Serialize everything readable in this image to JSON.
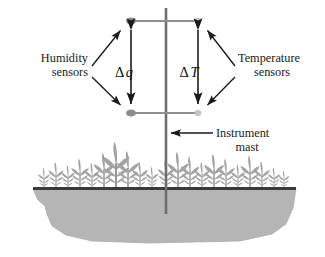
{
  "figure": {
    "type": "schematic-diagram",
    "width": 325,
    "height": 257,
    "background_color": "#ffffff"
  },
  "labels": {
    "humidity": {
      "line1": "Humidity",
      "line2": "sensors",
      "align": "right",
      "anchor_x": 88,
      "line1_y": 62,
      "line2_y": 76
    },
    "temperature": {
      "line1": "Temperature",
      "line2": "sensors",
      "align": "left",
      "anchor_x": 238,
      "line1_y": 62,
      "line2_y": 76
    },
    "instrument_mast": {
      "line1": "Instrument",
      "line2": "mast",
      "align": "left",
      "anchor_x": 216,
      "line1_y": 136,
      "line2_y": 150
    }
  },
  "measurements": [
    {
      "id": "delta-q",
      "symbol": "Δ",
      "variable": "q",
      "full": "Δq",
      "meaning": "specific humidity difference",
      "x": 124,
      "y": 72,
      "arrow_x": 131,
      "arrow_top_y": 28,
      "arrow_bottom_y": 105
    },
    {
      "id": "delta-t",
      "symbol": "Δ",
      "variable": "T",
      "full": "ΔT",
      "meaning": "temperature difference",
      "x": 189,
      "y": 72,
      "arrow_x": 198,
      "arrow_top_y": 28,
      "arrow_bottom_y": 105
    }
  ],
  "sensors": [
    {
      "id": "humidity-upper",
      "kind": "humidity",
      "level": "upper",
      "x": 131,
      "y": 21,
      "color": "#8c8c8c",
      "rx": 5.0,
      "ry": 3.6
    },
    {
      "id": "humidity-lower",
      "kind": "humidity",
      "level": "lower",
      "x": 131,
      "y": 113,
      "color": "#8c8c8c",
      "rx": 5.0,
      "ry": 3.6
    },
    {
      "id": "temperature-upper",
      "kind": "temperature",
      "level": "upper",
      "x": 198,
      "y": 21,
      "color": "#c2c2c2",
      "rx": 3.4,
      "ry": 3.0
    },
    {
      "id": "temperature-lower",
      "kind": "temperature",
      "level": "lower",
      "x": 198,
      "y": 113,
      "color": "#c2c2c2",
      "rx": 3.4,
      "ry": 3.0
    }
  ],
  "mast": {
    "id": "instrument-mast",
    "x": 166,
    "top_y": 8,
    "bottom_y": 214,
    "width": 2.6,
    "color": "#6e6e6e",
    "arms": [
      {
        "id": "upper-arm",
        "y": 21,
        "x1": 131,
        "x2": 198,
        "color": "#8f8f8f",
        "width": 2.0
      },
      {
        "id": "lower-arm",
        "y": 113,
        "x1": 131,
        "x2": 198,
        "color": "#8f8f8f",
        "width": 2.0
      }
    ]
  },
  "leader_lines": [
    {
      "id": "humidity-to-upper",
      "x1": 92,
      "y1": 66,
      "x2": 122,
      "y2": 30
    },
    {
      "id": "humidity-to-lower",
      "x1": 92,
      "y1": 76,
      "x2": 122,
      "y2": 106
    },
    {
      "id": "temperature-to-upper",
      "x1": 234,
      "y1": 66,
      "x2": 207,
      "y2": 30
    },
    {
      "id": "temperature-to-lower",
      "x1": 234,
      "y1": 76,
      "x2": 207,
      "y2": 106
    },
    {
      "id": "mast-pointer",
      "x1": 212,
      "y1": 133,
      "x2": 171,
      "y2": 133
    }
  ],
  "ground": {
    "id": "ground-line",
    "y": 188,
    "x1": 33,
    "x2": 296,
    "color": "#3a3a3a",
    "thickness": 3.2
  },
  "soil": {
    "id": "soil-body",
    "color": "#b5b5b5",
    "outline": "#a8a8a8",
    "path": "M 33,189 L 296,189 L 293,208 L 286,224 L 272,234 L 240,241 L 150,243 L 92,241 L 66,235 L 52,226 L 47,214 L 45,206 L 38,200 Z"
  },
  "vegetation": {
    "id": "vegetation-band",
    "color": "#a3a3a3",
    "stem_color": "#8f8f8f",
    "baseline_y": 188,
    "plants": [
      {
        "x": 44,
        "height": 14,
        "scale": 0.55
      },
      {
        "x": 56,
        "height": 20,
        "scale": 0.7
      },
      {
        "x": 68,
        "height": 17,
        "scale": 0.62
      },
      {
        "x": 80,
        "height": 24,
        "scale": 0.8
      },
      {
        "x": 92,
        "height": 19,
        "scale": 0.68
      },
      {
        "x": 104,
        "height": 30,
        "scale": 0.95
      },
      {
        "x": 116,
        "height": 42,
        "scale": 1.25
      },
      {
        "x": 128,
        "height": 33,
        "scale": 1.0
      },
      {
        "x": 140,
        "height": 21,
        "scale": 0.72
      },
      {
        "x": 152,
        "height": 16,
        "scale": 0.58
      },
      {
        "x": 166,
        "height": 23,
        "scale": 0.76
      },
      {
        "x": 178,
        "height": 31,
        "scale": 0.98
      },
      {
        "x": 190,
        "height": 26,
        "scale": 0.86
      },
      {
        "x": 202,
        "height": 20,
        "scale": 0.7
      },
      {
        "x": 214,
        "height": 29,
        "scale": 0.92
      },
      {
        "x": 226,
        "height": 24,
        "scale": 0.8
      },
      {
        "x": 238,
        "height": 18,
        "scale": 0.64
      },
      {
        "x": 250,
        "height": 27,
        "scale": 0.88
      },
      {
        "x": 262,
        "height": 21,
        "scale": 0.72
      },
      {
        "x": 274,
        "height": 15,
        "scale": 0.56
      },
      {
        "x": 284,
        "height": 12,
        "scale": 0.48
      }
    ]
  },
  "colors": {
    "line": "#1a1a1a",
    "mast": "#6e6e6e",
    "arm": "#8f8f8f",
    "sensor_dark": "#8c8c8c",
    "sensor_light": "#c2c2c2",
    "soil": "#b5b5b5",
    "vegetation": "#a3a3a3",
    "ground": "#3a3a3a",
    "text": "#1a1a1a"
  }
}
